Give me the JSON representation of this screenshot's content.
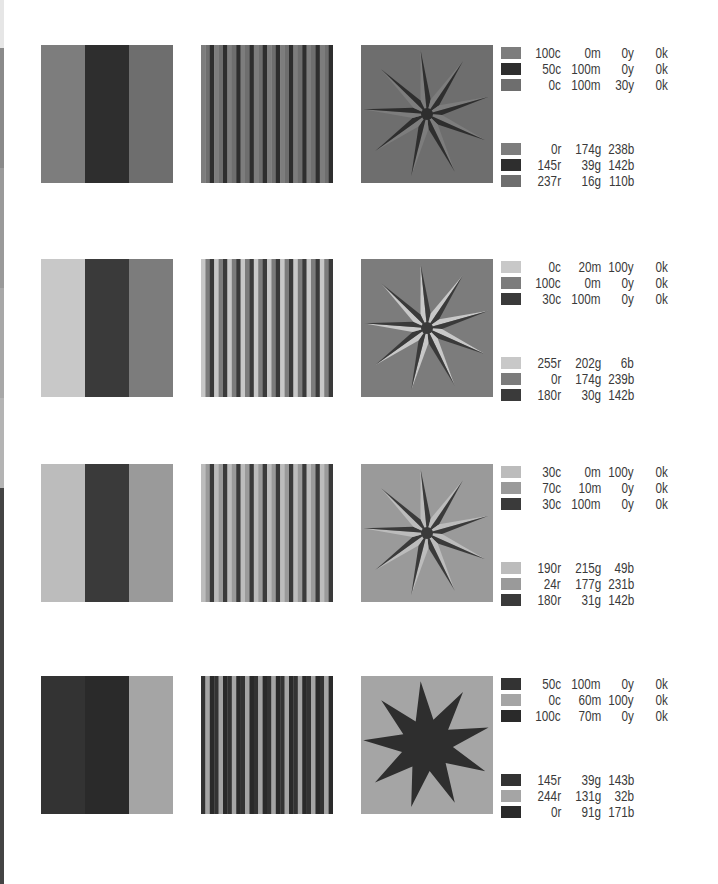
{
  "edge_strip": [
    {
      "top": 0,
      "height": 48,
      "color": "#e6e6e6"
    },
    {
      "top": 48,
      "height": 120,
      "color": "#8a8a8a"
    },
    {
      "top": 168,
      "height": 120,
      "color": "#9a9a9a"
    },
    {
      "top": 288,
      "height": 110,
      "color": "#a8a8a8"
    },
    {
      "top": 398,
      "height": 90,
      "color": "#b4b4b4"
    },
    {
      "top": 488,
      "height": 396,
      "color": "#444444"
    }
  ],
  "rows": [
    {
      "top": 45,
      "bars": [
        "#7d7d7d",
        "#2e2e2e",
        "#6e6e6e"
      ],
      "stripes": [
        "#7d7d7d",
        "#6e6e6e",
        "#2e2e2e"
      ],
      "star": {
        "background": "#6e6e6e",
        "light": "#7d7d7d",
        "dark": "#2e2e2e",
        "style": "split"
      },
      "cmyk": [
        {
          "swatch": "#7d7d7d",
          "c": "100c",
          "m": "0m",
          "y": "0y",
          "k": "0k"
        },
        {
          "swatch": "#2e2e2e",
          "c": "50c",
          "m": "100m",
          "y": "0y",
          "k": "0k"
        },
        {
          "swatch": "#6e6e6e",
          "c": "0c",
          "m": "100m",
          "y": "30y",
          "k": "0k"
        }
      ],
      "rgb": [
        {
          "swatch": "#7d7d7d",
          "r": "0r",
          "g": "174g",
          "b": "238b"
        },
        {
          "swatch": "#2e2e2e",
          "r": "145r",
          "g": "39g",
          "b": "142b"
        },
        {
          "swatch": "#6e6e6e",
          "r": "237r",
          "g": "16g",
          "b": "110b"
        }
      ]
    },
    {
      "top": 259,
      "bars": [
        "#c8c8c8",
        "#3a3a3a",
        "#7c7c7c"
      ],
      "stripes": [
        "#c8c8c8",
        "#7c7c7c",
        "#3a3a3a"
      ],
      "star": {
        "background": "#7c7c7c",
        "light": "#c8c8c8",
        "dark": "#3a3a3a",
        "style": "split"
      },
      "cmyk": [
        {
          "swatch": "#c8c8c8",
          "c": "0c",
          "m": "20m",
          "y": "100y",
          "k": "0k"
        },
        {
          "swatch": "#7c7c7c",
          "c": "100c",
          "m": "0m",
          "y": "0y",
          "k": "0k"
        },
        {
          "swatch": "#3a3a3a",
          "c": "30c",
          "m": "100m",
          "y": "0y",
          "k": "0k"
        }
      ],
      "rgb": [
        {
          "swatch": "#c8c8c8",
          "r": "255r",
          "g": "202g",
          "b": "6b"
        },
        {
          "swatch": "#7c7c7c",
          "r": "0r",
          "g": "174g",
          "b": "239b"
        },
        {
          "swatch": "#3a3a3a",
          "r": "180r",
          "g": "30g",
          "b": "142b"
        }
      ]
    },
    {
      "top": 464,
      "bars": [
        "#bcbcbc",
        "#3a3a3a",
        "#9a9a9a"
      ],
      "stripes": [
        "#bcbcbc",
        "#9a9a9a",
        "#3a3a3a"
      ],
      "star": {
        "background": "#9a9a9a",
        "light": "#bcbcbc",
        "dark": "#3a3a3a",
        "style": "split"
      },
      "cmyk": [
        {
          "swatch": "#bcbcbc",
          "c": "30c",
          "m": "0m",
          "y": "100y",
          "k": "0k"
        },
        {
          "swatch": "#9a9a9a",
          "c": "70c",
          "m": "10m",
          "y": "0y",
          "k": "0k"
        },
        {
          "swatch": "#3a3a3a",
          "c": "30c",
          "m": "100m",
          "y": "0y",
          "k": "0k"
        }
      ],
      "rgb": [
        {
          "swatch": "#bcbcbc",
          "r": "190r",
          "g": "215g",
          "b": "49b"
        },
        {
          "swatch": "#9a9a9a",
          "r": "24r",
          "g": "177g",
          "b": "231b"
        },
        {
          "swatch": "#3a3a3a",
          "r": "180r",
          "g": "31g",
          "b": "142b"
        }
      ]
    },
    {
      "top": 676,
      "bars": [
        "#333333",
        "#2a2a2a",
        "#a5a5a5"
      ],
      "stripes": [
        "#333333",
        "#a5a5a5",
        "#2a2a2a"
      ],
      "star": {
        "background": "#a5a5a5",
        "light": "#333333",
        "dark": "#2e2e2e",
        "style": "solid"
      },
      "cmyk": [
        {
          "swatch": "#333333",
          "c": "50c",
          "m": "100m",
          "y": "0y",
          "k": "0k"
        },
        {
          "swatch": "#a5a5a5",
          "c": "0c",
          "m": "60m",
          "y": "100y",
          "k": "0k"
        },
        {
          "swatch": "#2a2a2a",
          "c": "100c",
          "m": "70m",
          "y": "0y",
          "k": "0k"
        }
      ],
      "rgb": [
        {
          "swatch": "#333333",
          "r": "145r",
          "g": "39g",
          "b": "143b"
        },
        {
          "swatch": "#a5a5a5",
          "r": "244r",
          "g": "131g",
          "b": "32b"
        },
        {
          "swatch": "#2a2a2a",
          "r": "0r",
          "g": "91g",
          "b": "171b"
        }
      ]
    }
  ]
}
